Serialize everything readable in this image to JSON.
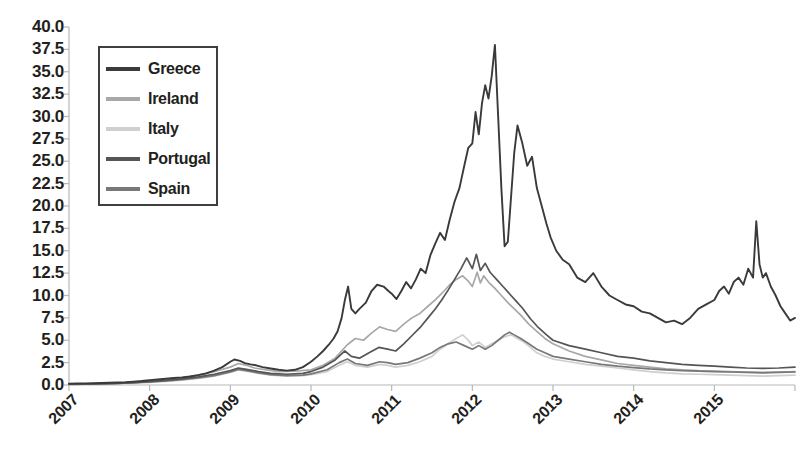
{
  "chart_data": {
    "type": "line",
    "title": "",
    "subtitle": "",
    "xlabel": "",
    "ylabel": "",
    "grid": false,
    "legend_position": "top-left",
    "xlim": [
      2007,
      2016
    ],
    "ylim": [
      0.0,
      40.0
    ],
    "ytick_step": 2.5,
    "ytick_labels": [
      "40.0",
      "37.5",
      "35.0",
      "32.5",
      "30.0",
      "27.5",
      "25.0",
      "22.5",
      "20.0",
      "17.5",
      "15.0",
      "12.5",
      "10.0",
      "7.5",
      "5.0",
      "2.5",
      "0.0"
    ],
    "ytick_values": [
      40.0,
      37.5,
      35.0,
      32.5,
      30.0,
      27.5,
      25.0,
      22.5,
      20.0,
      17.5,
      15.0,
      12.5,
      10.0,
      7.5,
      5.0,
      2.5,
      0.0
    ],
    "xtick_labels": [
      "2007",
      "2008",
      "2009",
      "2010",
      "2011",
      "2012",
      "2013",
      "2014",
      "2015"
    ],
    "xtick_values": [
      2007,
      2008,
      2009,
      2010,
      2011,
      2012,
      2013,
      2014,
      2015
    ],
    "colors": {
      "Greece": "#3a3a3a",
      "Ireland": "#a8a8a8",
      "Italy": "#cfcfcf",
      "Portugal": "#555555",
      "Spain": "#787878"
    },
    "series": [
      {
        "name": "Greece",
        "color": "#3a3a3a",
        "x": [
          2007.0,
          2007.1,
          2007.2,
          2007.3,
          2007.4,
          2007.5,
          2007.6,
          2007.7,
          2007.8,
          2007.9,
          2008.0,
          2008.1,
          2008.2,
          2008.3,
          2008.4,
          2008.5,
          2008.6,
          2008.7,
          2008.8,
          2008.9,
          2009.0,
          2009.05,
          2009.12,
          2009.18,
          2009.25,
          2009.32,
          2009.4,
          2009.5,
          2009.6,
          2009.7,
          2009.8,
          2009.9,
          2010.0,
          2010.08,
          2010.15,
          2010.22,
          2010.28,
          2010.33,
          2010.38,
          2010.42,
          2010.46,
          2010.5,
          2010.55,
          2010.6,
          2010.68,
          2010.75,
          2010.82,
          2010.9,
          2010.96,
          2011.0,
          2011.06,
          2011.12,
          2011.18,
          2011.24,
          2011.3,
          2011.36,
          2011.42,
          2011.48,
          2011.54,
          2011.6,
          2011.66,
          2011.72,
          2011.78,
          2011.84,
          2011.9,
          2011.95,
          2012.0,
          2012.04,
          2012.08,
          2012.12,
          2012.16,
          2012.2,
          2012.24,
          2012.28,
          2012.32,
          2012.36,
          2012.4,
          2012.44,
          2012.48,
          2012.52,
          2012.56,
          2012.62,
          2012.68,
          2012.74,
          2012.8,
          2012.86,
          2012.92,
          2012.97,
          2013.04,
          2013.12,
          2013.2,
          2013.3,
          2013.4,
          2013.5,
          2013.6,
          2013.7,
          2013.8,
          2013.9,
          2014.0,
          2014.1,
          2014.2,
          2014.3,
          2014.4,
          2014.5,
          2014.6,
          2014.7,
          2014.8,
          2014.9,
          2015.0,
          2015.06,
          2015.12,
          2015.18,
          2015.24,
          2015.3,
          2015.36,
          2015.42,
          2015.48,
          2015.52,
          2015.56,
          2015.6,
          2015.64,
          2015.7,
          2015.76,
          2015.82,
          2015.88,
          2015.94,
          2016.0
        ],
        "y": [
          0.15,
          0.16,
          0.18,
          0.2,
          0.22,
          0.25,
          0.28,
          0.32,
          0.38,
          0.45,
          0.55,
          0.62,
          0.7,
          0.78,
          0.85,
          0.95,
          1.1,
          1.3,
          1.6,
          2.0,
          2.6,
          2.85,
          2.7,
          2.45,
          2.3,
          2.2,
          2.0,
          1.85,
          1.7,
          1.6,
          1.7,
          2.0,
          2.6,
          3.2,
          3.8,
          4.5,
          5.2,
          6.0,
          7.5,
          9.5,
          11.0,
          8.5,
          8.0,
          8.5,
          9.2,
          10.5,
          11.2,
          11.0,
          10.5,
          10.2,
          9.6,
          10.5,
          11.5,
          10.8,
          11.8,
          13.0,
          12.5,
          14.5,
          15.8,
          17.0,
          16.2,
          18.5,
          20.5,
          22.0,
          24.5,
          26.5,
          27.0,
          30.5,
          28.0,
          31.5,
          33.5,
          32.0,
          34.5,
          38.0,
          30.0,
          22.0,
          15.5,
          16.0,
          21.0,
          26.0,
          29.0,
          27.0,
          24.5,
          25.5,
          22.0,
          20.0,
          18.0,
          16.5,
          15.0,
          14.0,
          13.5,
          12.0,
          11.5,
          12.5,
          11.0,
          10.0,
          9.5,
          9.0,
          8.8,
          8.2,
          8.0,
          7.5,
          7.0,
          7.2,
          6.8,
          7.5,
          8.5,
          9.0,
          9.5,
          10.5,
          11.0,
          10.2,
          11.5,
          12.0,
          11.2,
          13.0,
          12.0,
          18.3,
          13.5,
          12.0,
          12.5,
          11.0,
          10.0,
          8.8,
          8.0,
          7.2,
          7.5
        ]
      },
      {
        "name": "Ireland",
        "color": "#a8a8a8",
        "x": [
          2007.0,
          2007.2,
          2007.4,
          2007.6,
          2007.8,
          2008.0,
          2008.2,
          2008.4,
          2008.6,
          2008.8,
          2009.0,
          2009.1,
          2009.2,
          2009.3,
          2009.45,
          2009.6,
          2009.8,
          2010.0,
          2010.15,
          2010.3,
          2010.45,
          2010.55,
          2010.65,
          2010.75,
          2010.85,
          2010.95,
          2011.05,
          2011.15,
          2011.25,
          2011.35,
          2011.45,
          2011.55,
          2011.65,
          2011.72,
          2011.8,
          2011.88,
          2011.95,
          2012.0,
          2012.06,
          2012.1,
          2012.14,
          2012.2,
          2012.28,
          2012.36,
          2012.44,
          2012.52,
          2012.6,
          2012.7,
          2012.8,
          2012.9,
          2013.0,
          2013.2,
          2013.4,
          2013.6,
          2013.8,
          2014.0,
          2014.2,
          2014.4,
          2014.6,
          2014.8,
          2015.0,
          2015.2,
          2015.4,
          2015.6,
          2015.8,
          2016.0
        ],
        "y": [
          0.1,
          0.12,
          0.15,
          0.2,
          0.3,
          0.45,
          0.6,
          0.8,
          1.1,
          1.5,
          2.0,
          2.4,
          2.2,
          1.9,
          1.7,
          1.5,
          1.55,
          1.7,
          2.2,
          3.0,
          4.5,
          5.2,
          5.0,
          5.8,
          6.5,
          6.2,
          6.0,
          6.8,
          7.5,
          8.0,
          8.8,
          9.6,
          10.5,
          11.2,
          11.8,
          12.2,
          11.6,
          11.0,
          12.6,
          11.4,
          12.2,
          11.5,
          10.8,
          10.0,
          9.2,
          8.5,
          7.8,
          6.8,
          6.0,
          5.2,
          4.6,
          3.8,
          3.2,
          2.8,
          2.4,
          2.2,
          2.0,
          1.8,
          1.7,
          1.6,
          1.55,
          1.5,
          1.45,
          1.4,
          1.45,
          1.5
        ]
      },
      {
        "name": "Italy",
        "color": "#cfcfcf",
        "x": [
          2007.0,
          2007.2,
          2007.4,
          2007.6,
          2007.8,
          2008.0,
          2008.2,
          2008.4,
          2008.6,
          2008.8,
          2009.0,
          2009.1,
          2009.2,
          2009.35,
          2009.5,
          2009.7,
          2009.9,
          2010.0,
          2010.2,
          2010.35,
          2010.45,
          2010.55,
          2010.7,
          2010.85,
          2010.95,
          2011.05,
          2011.2,
          2011.35,
          2011.5,
          2011.6,
          2011.7,
          2011.8,
          2011.88,
          2011.95,
          2012.0,
          2012.08,
          2012.16,
          2012.24,
          2012.32,
          2012.4,
          2012.48,
          2012.56,
          2012.64,
          2012.72,
          2012.8,
          2012.9,
          2013.0,
          2013.2,
          2013.4,
          2013.6,
          2013.8,
          2014.0,
          2014.2,
          2014.4,
          2014.6,
          2014.8,
          2015.0,
          2015.2,
          2015.4,
          2015.6,
          2015.8,
          2016.0
        ],
        "y": [
          0.08,
          0.1,
          0.12,
          0.15,
          0.22,
          0.3,
          0.4,
          0.55,
          0.75,
          1.0,
          1.4,
          1.7,
          1.55,
          1.3,
          1.1,
          1.0,
          1.05,
          1.15,
          1.5,
          2.2,
          2.6,
          2.2,
          2.0,
          2.3,
          2.2,
          2.0,
          2.2,
          2.6,
          3.2,
          4.0,
          4.6,
          5.2,
          5.6,
          5.0,
          4.4,
          4.8,
          4.2,
          4.6,
          5.0,
          5.4,
          5.6,
          5.2,
          4.8,
          4.2,
          3.6,
          3.2,
          2.9,
          2.6,
          2.3,
          2.1,
          1.9,
          1.7,
          1.5,
          1.35,
          1.25,
          1.2,
          1.15,
          1.1,
          1.05,
          1.0,
          1.05,
          1.1
        ]
      },
      {
        "name": "Portugal",
        "color": "#555555",
        "x": [
          2007.0,
          2007.2,
          2007.4,
          2007.6,
          2007.8,
          2008.0,
          2008.2,
          2008.4,
          2008.6,
          2008.8,
          2009.0,
          2009.1,
          2009.2,
          2009.35,
          2009.5,
          2009.7,
          2009.9,
          2010.0,
          2010.15,
          2010.3,
          2010.42,
          2010.5,
          2010.6,
          2010.72,
          2010.84,
          2010.95,
          2011.05,
          2011.15,
          2011.25,
          2011.35,
          2011.45,
          2011.55,
          2011.62,
          2011.7,
          2011.78,
          2011.86,
          2011.93,
          2012.0,
          2012.05,
          2012.1,
          2012.16,
          2012.22,
          2012.3,
          2012.38,
          2012.46,
          2012.54,
          2012.62,
          2012.72,
          2012.82,
          2012.92,
          2013.0,
          2013.2,
          2013.4,
          2013.6,
          2013.8,
          2014.0,
          2014.2,
          2014.4,
          2014.6,
          2014.8,
          2015.0,
          2015.2,
          2015.4,
          2015.6,
          2015.8,
          2016.0
        ],
        "y": [
          0.1,
          0.12,
          0.14,
          0.18,
          0.26,
          0.38,
          0.5,
          0.68,
          0.9,
          1.2,
          1.6,
          1.9,
          1.75,
          1.5,
          1.3,
          1.2,
          1.3,
          1.5,
          2.0,
          2.8,
          3.8,
          3.2,
          3.0,
          3.6,
          4.2,
          4.0,
          3.8,
          4.6,
          5.5,
          6.4,
          7.5,
          8.6,
          9.5,
          10.6,
          11.8,
          13.0,
          14.2,
          13.0,
          14.6,
          12.8,
          13.6,
          12.6,
          11.8,
          11.0,
          10.2,
          9.4,
          8.6,
          7.4,
          6.4,
          5.6,
          5.0,
          4.4,
          4.0,
          3.6,
          3.2,
          3.0,
          2.7,
          2.5,
          2.3,
          2.2,
          2.1,
          2.0,
          1.9,
          1.85,
          1.9,
          2.0
        ]
      },
      {
        "name": "Spain",
        "color": "#787878",
        "x": [
          2007.0,
          2007.2,
          2007.4,
          2007.6,
          2007.8,
          2008.0,
          2008.2,
          2008.4,
          2008.6,
          2008.8,
          2009.0,
          2009.1,
          2009.2,
          2009.35,
          2009.5,
          2009.7,
          2009.9,
          2010.0,
          2010.2,
          2010.35,
          2010.45,
          2010.55,
          2010.7,
          2010.85,
          2010.95,
          2011.05,
          2011.2,
          2011.35,
          2011.5,
          2011.6,
          2011.7,
          2011.8,
          2011.9,
          2012.0,
          2012.08,
          2012.16,
          2012.24,
          2012.32,
          2012.4,
          2012.46,
          2012.52,
          2012.6,
          2012.7,
          2012.8,
          2012.9,
          2013.0,
          2013.2,
          2013.4,
          2013.6,
          2013.8,
          2014.0,
          2014.2,
          2014.4,
          2014.6,
          2014.8,
          2015.0,
          2015.2,
          2015.4,
          2015.6,
          2015.8,
          2016.0
        ],
        "y": [
          0.08,
          0.1,
          0.13,
          0.17,
          0.25,
          0.35,
          0.45,
          0.6,
          0.8,
          1.05,
          1.45,
          1.75,
          1.6,
          1.35,
          1.15,
          1.05,
          1.1,
          1.25,
          1.7,
          2.5,
          2.9,
          2.4,
          2.2,
          2.6,
          2.5,
          2.3,
          2.5,
          3.0,
          3.6,
          4.2,
          4.6,
          4.8,
          4.4,
          4.0,
          4.4,
          4.0,
          4.4,
          5.0,
          5.6,
          5.9,
          5.6,
          5.2,
          4.6,
          4.0,
          3.6,
          3.2,
          2.9,
          2.6,
          2.3,
          2.1,
          1.95,
          1.8,
          1.7,
          1.6,
          1.55,
          1.5,
          1.45,
          1.4,
          1.35,
          1.4,
          1.45
        ]
      }
    ]
  },
  "axes": {
    "y_labels": [
      "40.0",
      "37.5",
      "35.0",
      "32.5",
      "30.0",
      "27.5",
      "25.0",
      "22.5",
      "20.0",
      "17.5",
      "15.0",
      "12.5",
      "10.0",
      "7.5",
      "5.0",
      "2.5",
      "0.0"
    ],
    "x_labels": [
      "2007",
      "2008",
      "2009",
      "2010",
      "2011",
      "2012",
      "2013",
      "2014",
      "2015"
    ]
  },
  "legend": {
    "items": [
      {
        "label": "Greece",
        "color": "#3a3a3a"
      },
      {
        "label": "Ireland",
        "color": "#a8a8a8"
      },
      {
        "label": "Italy",
        "color": "#cfcfcf"
      },
      {
        "label": "Portugal",
        "color": "#555555"
      },
      {
        "label": "Spain",
        "color": "#787878"
      }
    ]
  }
}
